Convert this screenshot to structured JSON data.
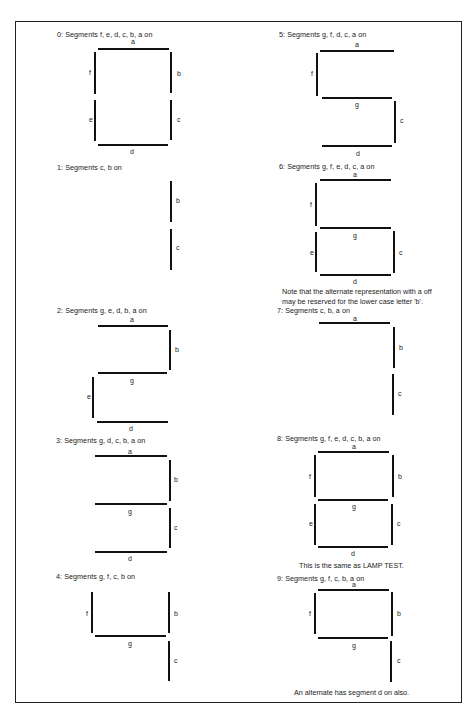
{
  "figure": {
    "panels": [
      {
        "digit": "0",
        "caption": "0:  Segments f, e, d, c, b, a on",
        "caption_pos": [
          57,
          30
        ],
        "segments": [
          {
            "id": "a",
            "orient": "h",
            "x": 98,
            "y": 48,
            "len": 71,
            "lx": 131,
            "ly": 38
          },
          {
            "id": "f",
            "orient": "v",
            "x": 94,
            "y": 52,
            "len": 42,
            "lx": 89,
            "ly": 69
          },
          {
            "id": "b",
            "orient": "v",
            "x": 170,
            "y": 52,
            "len": 41,
            "lx": 177,
            "ly": 70
          },
          {
            "id": "e",
            "orient": "v",
            "x": 94,
            "y": 100,
            "len": 41,
            "lx": 89,
            "ly": 116
          },
          {
            "id": "c",
            "orient": "v",
            "x": 170,
            "y": 100,
            "len": 40,
            "lx": 177,
            "ly": 116
          },
          {
            "id": "d",
            "orient": "h",
            "x": 98,
            "y": 144,
            "len": 70,
            "lx": 130,
            "ly": 148
          }
        ]
      },
      {
        "digit": "1",
        "caption": "1:  Segments c, b on",
        "caption_pos": [
          57,
          163
        ],
        "segments": [
          {
            "id": "b",
            "orient": "v",
            "x": 170,
            "y": 181,
            "len": 41,
            "lx": 176,
            "ly": 197
          },
          {
            "id": "c",
            "orient": "v",
            "x": 170,
            "y": 229,
            "len": 41,
            "lx": 176,
            "ly": 244
          }
        ]
      },
      {
        "digit": "2",
        "caption": "2:  Segments g, e, d, b, a on",
        "caption_pos": [
          57,
          306
        ],
        "segments": [
          {
            "id": "a",
            "orient": "h",
            "x": 98,
            "y": 325,
            "len": 70,
            "lx": 130,
            "ly": 316
          },
          {
            "id": "b",
            "orient": "v",
            "x": 169,
            "y": 330,
            "len": 40,
            "lx": 175,
            "ly": 346
          },
          {
            "id": "g",
            "orient": "h",
            "x": 98,
            "y": 372,
            "len": 69,
            "lx": 130,
            "ly": 377
          },
          {
            "id": "e",
            "orient": "v",
            "x": 92,
            "y": 377,
            "len": 41,
            "lx": 87,
            "ly": 393
          },
          {
            "id": "d",
            "orient": "h",
            "x": 97,
            "y": 421,
            "len": 71,
            "lx": 129,
            "ly": 425
          }
        ]
      },
      {
        "digit": "3",
        "caption": "3:  Segments g, d, c, b, a on",
        "caption_pos": [
          56,
          436
        ],
        "segments": [
          {
            "id": "a",
            "orient": "h",
            "x": 95,
            "y": 455,
            "len": 72,
            "lx": 128,
            "ly": 448
          },
          {
            "id": "b",
            "orient": "v",
            "x": 169,
            "y": 460,
            "len": 41,
            "lx": 174,
            "ly": 476
          },
          {
            "id": "g",
            "orient": "h",
            "x": 95,
            "y": 503,
            "len": 72,
            "lx": 128,
            "ly": 508
          },
          {
            "id": "c",
            "orient": "v",
            "x": 169,
            "y": 508,
            "len": 40,
            "lx": 174,
            "ly": 524
          },
          {
            "id": "d",
            "orient": "h",
            "x": 95,
            "y": 551,
            "len": 72,
            "lx": 128,
            "ly": 555
          }
        ]
      },
      {
        "digit": "4",
        "caption": "4:  Segments g, f, c, b on",
        "caption_pos": [
          56,
          572
        ],
        "segments": [
          {
            "id": "f",
            "orient": "v",
            "x": 91,
            "y": 592,
            "len": 41,
            "lx": 86,
            "ly": 610
          },
          {
            "id": "b",
            "orient": "v",
            "x": 168,
            "y": 592,
            "len": 41,
            "lx": 174,
            "ly": 610
          },
          {
            "id": "g",
            "orient": "h",
            "x": 95,
            "y": 635,
            "len": 71,
            "lx": 128,
            "ly": 640
          },
          {
            "id": "c",
            "orient": "v",
            "x": 168,
            "y": 641,
            "len": 40,
            "lx": 174,
            "ly": 657
          }
        ]
      },
      {
        "digit": "5",
        "caption": "5:  Segments g, f, d, c, a on",
        "caption_pos": [
          279,
          30
        ],
        "segments": [
          {
            "id": "a",
            "orient": "h",
            "x": 320,
            "y": 50,
            "len": 74,
            "lx": 355,
            "ly": 41
          },
          {
            "id": "f",
            "orient": "v",
            "x": 316,
            "y": 53,
            "len": 43,
            "lx": 311,
            "ly": 70
          },
          {
            "id": "g",
            "orient": "h",
            "x": 322,
            "y": 97,
            "len": 70,
            "lx": 355,
            "ly": 101
          },
          {
            "id": "c",
            "orient": "v",
            "x": 394,
            "y": 101,
            "len": 42,
            "lx": 400,
            "ly": 117
          },
          {
            "id": "d",
            "orient": "h",
            "x": 322,
            "y": 145,
            "len": 70,
            "lx": 356,
            "ly": 150
          }
        ]
      },
      {
        "digit": "6",
        "caption": "6:  Segments g, f, e, d, c, a on",
        "caption_pos": [
          279,
          162
        ],
        "segments": [
          {
            "id": "a",
            "orient": "h",
            "x": 320,
            "y": 179,
            "len": 71,
            "lx": 353,
            "ly": 171
          },
          {
            "id": "f",
            "orient": "v",
            "x": 315,
            "y": 183,
            "len": 43,
            "lx": 310,
            "ly": 201
          },
          {
            "id": "g",
            "orient": "h",
            "x": 320,
            "y": 227,
            "len": 71,
            "lx": 353,
            "ly": 232
          },
          {
            "id": "e",
            "orient": "v",
            "x": 315,
            "y": 232,
            "len": 40,
            "lx": 310,
            "ly": 249
          },
          {
            "id": "c",
            "orient": "v",
            "x": 393,
            "y": 231,
            "len": 42,
            "lx": 399,
            "ly": 249
          },
          {
            "id": "d",
            "orient": "h",
            "x": 320,
            "y": 274,
            "len": 71,
            "lx": 353,
            "ly": 278
          }
        ],
        "note": [
          "Note that the alternate representation with a off",
          "may be reserved for the lower case letter  'b'."
        ],
        "note_pos": [
          282,
          287
        ]
      },
      {
        "digit": "7",
        "caption": "7:  Segments c, b, a on",
        "caption_pos": [
          277,
          306
        ],
        "segments": [
          {
            "id": "a",
            "orient": "h",
            "x": 319,
            "y": 322,
            "len": 71,
            "lx": 353,
            "ly": 315
          },
          {
            "id": "b",
            "orient": "v",
            "x": 393,
            "y": 327,
            "len": 41,
            "lx": 399,
            "ly": 344
          },
          {
            "id": "c",
            "orient": "v",
            "x": 392,
            "y": 374,
            "len": 41,
            "lx": 398,
            "ly": 390
          }
        ]
      },
      {
        "digit": "8",
        "caption": "8:  Segments g, f, e, d, c, b, a on",
        "caption_pos": [
          277,
          434
        ],
        "segments": [
          {
            "id": "a",
            "orient": "h",
            "x": 318,
            "y": 451,
            "len": 71,
            "lx": 352,
            "ly": 443
          },
          {
            "id": "f",
            "orient": "v",
            "x": 314,
            "y": 455,
            "len": 42,
            "lx": 309,
            "ly": 473
          },
          {
            "id": "b",
            "orient": "v",
            "x": 392,
            "y": 455,
            "len": 42,
            "lx": 398,
            "ly": 473
          },
          {
            "id": "g",
            "orient": "h",
            "x": 318,
            "y": 499,
            "len": 70,
            "lx": 352,
            "ly": 503
          },
          {
            "id": "e",
            "orient": "v",
            "x": 314,
            "y": 504,
            "len": 41,
            "lx": 309,
            "ly": 520
          },
          {
            "id": "c",
            "orient": "v",
            "x": 391,
            "y": 504,
            "len": 41,
            "lx": 397,
            "ly": 520
          },
          {
            "id": "d",
            "orient": "h",
            "x": 318,
            "y": 546,
            "len": 70,
            "lx": 351,
            "ly": 550
          }
        ],
        "note": [
          "This is the same as LAMP TEST."
        ],
        "note_pos": [
          299,
          561
        ]
      },
      {
        "digit": "9",
        "caption": "9:  Segments g, f, c, b, a on",
        "caption_pos": [
          277,
          574
        ],
        "segments": [
          {
            "id": "a",
            "orient": "h",
            "x": 318,
            "y": 589,
            "len": 71,
            "lx": 352,
            "ly": 581
          },
          {
            "id": "f",
            "orient": "v",
            "x": 314,
            "y": 593,
            "len": 41,
            "lx": 309,
            "ly": 610
          },
          {
            "id": "b",
            "orient": "v",
            "x": 391,
            "y": 592,
            "len": 44,
            "lx": 397,
            "ly": 610
          },
          {
            "id": "g",
            "orient": "h",
            "x": 318,
            "y": 637,
            "len": 70,
            "lx": 352,
            "ly": 642
          },
          {
            "id": "c",
            "orient": "v",
            "x": 390,
            "y": 641,
            "len": 41,
            "lx": 397,
            "ly": 657
          }
        ],
        "note": [
          "An alternate has segment d on also."
        ],
        "note_pos": [
          294,
          688
        ]
      }
    ]
  }
}
